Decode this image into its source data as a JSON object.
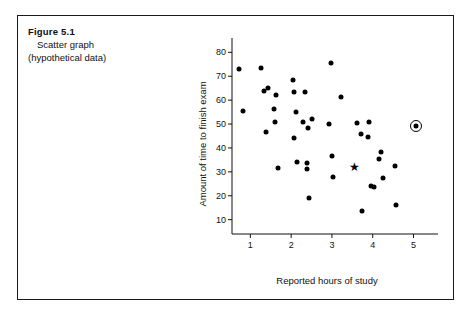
{
  "caption": {
    "figure_number": "Figure 5.1",
    "line1": "Scatter graph",
    "line2": "(hypothetical data)"
  },
  "chart_data": {
    "type": "scatter",
    "title": "Scatter graph (hypothetical data)",
    "xlabel": "Reported hours of study",
    "ylabel": "Amount of time to finish exam",
    "xlim": [
      0.55,
      5.6
    ],
    "ylim": [
      4,
      86
    ],
    "xticks": [
      1,
      2,
      3,
      4,
      5
    ],
    "yticks": [
      10,
      20,
      30,
      40,
      50,
      60,
      70,
      80
    ],
    "xtick_labels": [
      "1",
      "2",
      "3",
      "4",
      "5"
    ],
    "ytick_labels": [
      "10",
      "20",
      "30",
      "40",
      "50",
      "60",
      "70",
      "80"
    ],
    "grid": false,
    "legend": null,
    "marker_color": "#000000",
    "axis_color": "#111111",
    "points": [
      {
        "x": 0.73,
        "y": 73.0,
        "marker": "dot"
      },
      {
        "x": 0.83,
        "y": 55.5,
        "marker": "dot"
      },
      {
        "x": 1.27,
        "y": 73.5,
        "marker": "dot"
      },
      {
        "x": 1.33,
        "y": 64.0,
        "marker": "dot"
      },
      {
        "x": 1.43,
        "y": 65.0,
        "marker": "dot"
      },
      {
        "x": 1.38,
        "y": 46.5,
        "marker": "dot"
      },
      {
        "x": 1.62,
        "y": 62.0,
        "marker": "dot"
      },
      {
        "x": 1.57,
        "y": 56.5,
        "marker": "dot"
      },
      {
        "x": 1.6,
        "y": 51.0,
        "marker": "dot"
      },
      {
        "x": 1.67,
        "y": 31.5,
        "marker": "dot"
      },
      {
        "x": 2.05,
        "y": 68.5,
        "marker": "dot"
      },
      {
        "x": 2.08,
        "y": 63.5,
        "marker": "dot"
      },
      {
        "x": 2.12,
        "y": 55.0,
        "marker": "dot"
      },
      {
        "x": 2.06,
        "y": 44.0,
        "marker": "dot"
      },
      {
        "x": 2.14,
        "y": 34.0,
        "marker": "dot"
      },
      {
        "x": 2.33,
        "y": 63.5,
        "marker": "dot"
      },
      {
        "x": 2.28,
        "y": 51.0,
        "marker": "dot"
      },
      {
        "x": 2.42,
        "y": 48.5,
        "marker": "dot"
      },
      {
        "x": 2.4,
        "y": 33.5,
        "marker": "dot"
      },
      {
        "x": 2.38,
        "y": 31.0,
        "marker": "dot"
      },
      {
        "x": 2.5,
        "y": 52.0,
        "marker": "dot"
      },
      {
        "x": 2.44,
        "y": 19.0,
        "marker": "dot"
      },
      {
        "x": 2.97,
        "y": 75.5,
        "marker": "dot"
      },
      {
        "x": 2.93,
        "y": 50.0,
        "marker": "dot"
      },
      {
        "x": 3.0,
        "y": 36.5,
        "marker": "dot"
      },
      {
        "x": 3.02,
        "y": 28.0,
        "marker": "dot"
      },
      {
        "x": 3.22,
        "y": 61.5,
        "marker": "dot"
      },
      {
        "x": 3.55,
        "y": 32.0,
        "marker": "star"
      },
      {
        "x": 3.62,
        "y": 50.5,
        "marker": "dot"
      },
      {
        "x": 3.71,
        "y": 46.0,
        "marker": "dot"
      },
      {
        "x": 3.74,
        "y": 13.5,
        "marker": "dot"
      },
      {
        "x": 3.9,
        "y": 51.0,
        "marker": "dot"
      },
      {
        "x": 3.88,
        "y": 44.5,
        "marker": "dot"
      },
      {
        "x": 3.96,
        "y": 24.0,
        "marker": "dot"
      },
      {
        "x": 4.04,
        "y": 23.5,
        "marker": "dot"
      },
      {
        "x": 4.2,
        "y": 38.5,
        "marker": "dot"
      },
      {
        "x": 4.15,
        "y": 35.5,
        "marker": "dot"
      },
      {
        "x": 4.25,
        "y": 27.5,
        "marker": "dot"
      },
      {
        "x": 4.55,
        "y": 32.5,
        "marker": "dot"
      },
      {
        "x": 4.58,
        "y": 16.0,
        "marker": "dot"
      },
      {
        "x": 5.05,
        "y": 49.0,
        "marker": "circled-dot"
      }
    ]
  }
}
